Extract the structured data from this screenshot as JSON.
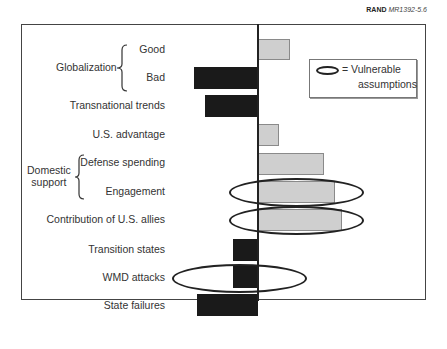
{
  "credit": {
    "org": "RAND",
    "id": "MR1392-5.6"
  },
  "legend": {
    "line1": "= Vulnerable",
    "line2": "assumptions"
  },
  "groups": {
    "globalization": "Globalization",
    "domestic_line1": "Domestic",
    "domestic_line2": "support"
  },
  "labels": [
    "Good",
    "Bad",
    "Transnational trends",
    "U.S. advantage",
    "Defense spending",
    "Engagement",
    "Contribution of U.S. allies",
    "Transition states",
    "WMD attacks",
    "State failures"
  ],
  "colors": {
    "positive": "#cfcfcf",
    "negative": "#1a1a1a",
    "axis": "#222222"
  },
  "chart_data": {
    "type": "bar",
    "orientation": "horizontal",
    "title": "",
    "xlabel": "",
    "ylabel": "",
    "grid": false,
    "categories": [
      "Globalization: Good",
      "Globalization: Bad",
      "Transnational trends",
      "U.S. advantage",
      "Domestic support: Defense spending",
      "Domestic support: Engagement",
      "Contribution of U.S. allies",
      "Transition states",
      "WMD attacks",
      "State failures"
    ],
    "values": [
      32,
      -64,
      -53,
      21,
      66,
      77,
      84,
      -25,
      -25,
      -61
    ],
    "units": "relative (pixel-scale, no axis ticks shown)",
    "vulnerable_assumptions": [
      "Domestic support: Engagement",
      "Contribution of U.S. allies",
      "WMD attacks"
    ],
    "legend": {
      "position": "upper right",
      "entries": [
        "Vulnerable assumptions (ellipse)"
      ]
    },
    "source": "RAND MR1392-5.6"
  }
}
